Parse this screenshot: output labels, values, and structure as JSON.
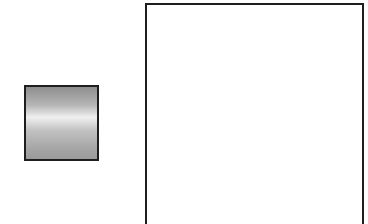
{
  "diagram": {
    "elements": [
      {
        "id": "small-block",
        "shape": "square",
        "fill": "vertical-gradient",
        "colors": [
          "#8e8e8e",
          "#f0f0f0",
          "#9a9a9a"
        ],
        "border": "#1e1e1e"
      },
      {
        "id": "large-box",
        "shape": "rectangle",
        "fill": "#ffffff",
        "border": "#1e1e1e",
        "extends_beyond_bottom": true
      }
    ],
    "labels": []
  }
}
